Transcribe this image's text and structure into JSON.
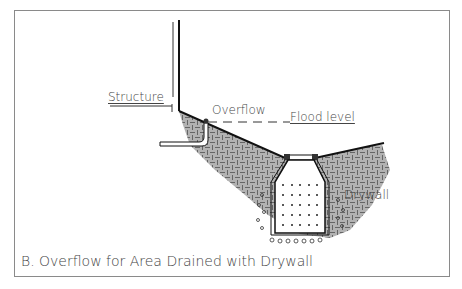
{
  "diagram": {
    "caption": "B. Overflow for Area Drained with Drywall",
    "labels": {
      "structure": "Structure",
      "overflow": "Overflow",
      "flood_level": "Flood level",
      "drywall": "Drywall"
    },
    "colors": {
      "line": "#111111",
      "text": "#444444",
      "border": "#8a8a8a"
    }
  }
}
